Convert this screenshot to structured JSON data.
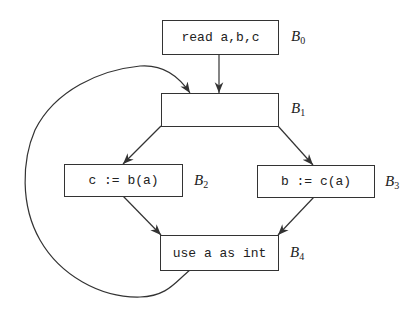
{
  "diagram": {
    "type": "control-flow-graph",
    "nodes": [
      {
        "id": "B0",
        "label_letter": "B",
        "label_sub": "0",
        "code": "read a,b,c"
      },
      {
        "id": "B1",
        "label_letter": "B",
        "label_sub": "1",
        "code": ""
      },
      {
        "id": "B2",
        "label_letter": "B",
        "label_sub": "2",
        "code": "c := b(a)"
      },
      {
        "id": "B3",
        "label_letter": "B",
        "label_sub": "3",
        "code": "b := c(a)"
      },
      {
        "id": "B4",
        "label_letter": "B",
        "label_sub": "4",
        "code": "use a as int"
      }
    ],
    "edges": [
      {
        "from": "B0",
        "to": "B1"
      },
      {
        "from": "B1",
        "to": "B2"
      },
      {
        "from": "B1",
        "to": "B3"
      },
      {
        "from": "B2",
        "to": "B4"
      },
      {
        "from": "B3",
        "to": "B4"
      },
      {
        "from": "B4",
        "to": "B1",
        "kind": "back-edge"
      }
    ],
    "colors": {
      "stroke": "#333333",
      "background": "#ffffff"
    }
  }
}
